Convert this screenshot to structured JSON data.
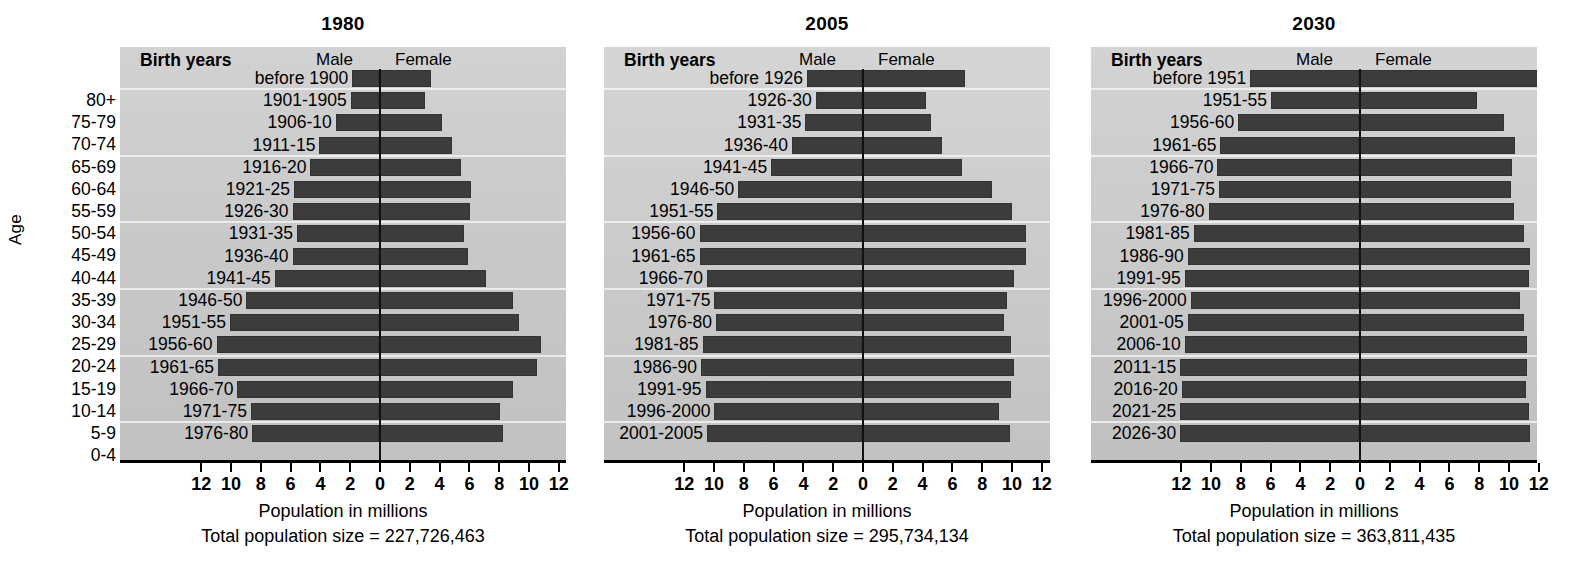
{
  "figure": {
    "y_axis_label": "Age",
    "age_groups": [
      "80+",
      "75-79",
      "70-74",
      "65-69",
      "60-64",
      "55-59",
      "50-54",
      "45-49",
      "40-44",
      "35-39",
      "30-34",
      "25-29",
      "20-24",
      "15-19",
      "10-14",
      "5-9",
      "0-4"
    ],
    "column_headers": {
      "birth_years": "Birth years",
      "male": "Male",
      "female": "Female"
    },
    "x_axis_label": "Population in millions",
    "tick_labels": [
      "12",
      "10",
      "8",
      "6",
      "4",
      "2",
      "0",
      "2",
      "4",
      "6",
      "8",
      "10",
      "12"
    ],
    "total_prefix": "Total population size = ",
    "colors": {
      "bar": "#3c3c3c",
      "plot_background": "#cacaca",
      "zero_line": "#111111",
      "gridline": "#f2f2f2"
    }
  },
  "chart_data": {
    "type": "bar",
    "xlabel": "Population in millions",
    "ylabel": "Age",
    "xlim": [
      -12,
      12
    ],
    "grid": true,
    "legend": [
      "Male",
      "Female"
    ],
    "categories": [
      "80+",
      "75-79",
      "70-74",
      "65-69",
      "60-64",
      "55-59",
      "50-54",
      "45-49",
      "40-44",
      "35-39",
      "30-34",
      "25-29",
      "20-24",
      "15-19",
      "10-14",
      "5-9",
      "0-4"
    ],
    "panels": [
      {
        "title": "1980",
        "total_population": "227,726,463",
        "birth_years": [
          "before 1900",
          "1901-1905",
          "1906-10",
          "1911-15",
          "1916-20",
          "1921-25",
          "1926-30",
          "1931-35",
          "1936-40",
          "1941-45",
          "1946-50",
          "1951-55",
          "1956-60",
          "1961-65",
          "1966-70",
          "1971-75",
          "1976-80"
        ],
        "series": [
          {
            "name": "Male",
            "values": [
              1.8,
              1.9,
              2.9,
              4.0,
              4.6,
              5.7,
              5.8,
              5.5,
              5.8,
              7.0,
              8.9,
              10.0,
              10.9,
              10.8,
              9.5,
              8.6,
              8.5
            ]
          },
          {
            "name": "Female",
            "values": [
              3.5,
              3.1,
              4.2,
              4.9,
              5.5,
              6.2,
              6.1,
              5.7,
              6.0,
              7.2,
              9.0,
              9.4,
              10.9,
              10.6,
              9.0,
              8.1,
              8.3
            ]
          }
        ]
      },
      {
        "title": "2005",
        "total_population": "295,734,134",
        "birth_years": [
          "before 1926",
          "1926-30",
          "1931-35",
          "1936-40",
          "1941-45",
          "1946-50",
          "1951-55",
          "1956-60",
          "1961-65",
          "1966-70",
          "1971-75",
          "1976-80",
          "1981-85",
          "1986-90",
          "1991-95",
          "1996-2000",
          "2001-2005"
        ],
        "series": [
          {
            "name": "Male",
            "values": [
              3.7,
              3.1,
              3.8,
              4.7,
              6.1,
              8.3,
              9.7,
              10.9,
              10.9,
              10.4,
              9.9,
              9.8,
              10.7,
              10.8,
              10.5,
              9.9,
              10.4
            ]
          },
          {
            "name": "Female",
            "values": [
              6.9,
              4.3,
              4.6,
              5.4,
              6.7,
              8.7,
              10.1,
              11.0,
              11.0,
              10.2,
              9.7,
              9.5,
              10.0,
              10.2,
              10.0,
              9.2,
              9.9
            ]
          }
        ]
      },
      {
        "title": "2030",
        "total_population": "363,811,435",
        "birth_years": [
          "before 1951",
          "1951-55",
          "1956-60",
          "1961-65",
          "1966-70",
          "1971-75",
          "1976-80",
          "1981-85",
          "1986-90",
          "1991-95",
          "1996-2000",
          "2001-05",
          "2006-10",
          "2011-15",
          "2016-20",
          "2021-25",
          "2026-30"
        ],
        "series": [
          {
            "name": "Male",
            "values": [
              7.3,
              5.9,
              8.1,
              9.3,
              9.5,
              9.4,
              10.1,
              11.1,
              11.5,
              11.7,
              11.3,
              11.5,
              11.7,
              12.0,
              11.9,
              12.0,
              12.0
            ]
          },
          {
            "name": "Female",
            "values": [
              12.0,
              7.9,
              9.7,
              10.5,
              10.3,
              10.2,
              10.4,
              11.1,
              11.5,
              11.4,
              10.8,
              11.1,
              11.3,
              11.3,
              11.2,
              11.4,
              11.5
            ]
          }
        ]
      }
    ]
  }
}
